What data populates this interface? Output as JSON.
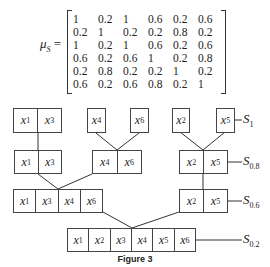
{
  "matrix": {
    "symbol": "μ",
    "subscript": "S",
    "equals": "=",
    "rows": [
      [
        "1",
        "0.2",
        "1",
        "0.6",
        "0.2",
        "0.6"
      ],
      [
        "0.2",
        "1",
        "0.2",
        "0.2",
        "0.8",
        "0.2"
      ],
      [
        "1",
        "0.2",
        "1",
        "0.6",
        "0.2",
        "0.6"
      ],
      [
        "0.6",
        "0.2",
        "0.6",
        "1",
        "0.2",
        "0.8"
      ],
      [
        "0.2",
        "0.8",
        "0.2",
        "0.2",
        "1",
        "0.2"
      ],
      [
        "0.6",
        "0.2",
        "0.6",
        "0.8",
        "0.2",
        "1"
      ]
    ]
  },
  "diagram": {
    "levels": [
      {
        "label": "S",
        "sub": "1",
        "clusters": [
          [
            "1",
            "3"
          ],
          [
            "4"
          ],
          [
            "6"
          ],
          [
            "2"
          ],
          [
            "5"
          ]
        ]
      },
      {
        "label": "S",
        "sub": "0.8",
        "clusters": [
          [
            "1",
            "3"
          ],
          [
            "4",
            "6"
          ],
          [
            "2",
            "5"
          ]
        ]
      },
      {
        "label": "S",
        "sub": "0.6",
        "clusters": [
          [
            "1",
            "3",
            "4",
            "6"
          ],
          [
            "2",
            "5"
          ]
        ]
      },
      {
        "label": "S",
        "sub": "0.2",
        "clusters": [
          [
            "1",
            "2",
            "3",
            "4",
            "5",
            "6"
          ]
        ]
      }
    ],
    "var": "x"
  },
  "caption": "Figure 3"
}
